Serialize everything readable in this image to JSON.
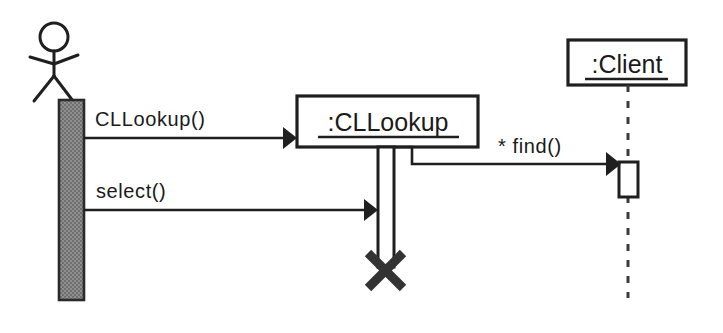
{
  "diagram": {
    "kind": "uml-sequence-diagram",
    "background_color": "#ffffff",
    "line_color": "#1f1f1f",
    "actor": {
      "name": "actor-stick-figure",
      "label": "",
      "activation_fill": "#8a8a8a"
    },
    "participants": [
      {
        "id": "cllookup",
        "label": ":CLLookup",
        "underlined": true,
        "lifeline_style": "activation-bar"
      },
      {
        "id": "client",
        "label": ":Client",
        "underlined": true,
        "lifeline_style": "dashed"
      }
    ],
    "messages": [
      {
        "id": "m1",
        "label": "CLLookup()",
        "from": "actor",
        "to": "cllookup",
        "arrow": "filled-solid"
      },
      {
        "id": "m2",
        "label": "* find()",
        "from": "cllookup",
        "to": "client",
        "arrow": "filled-solid",
        "iteration_marker": "*"
      },
      {
        "id": "m3",
        "label": "select()",
        "from": "actor",
        "to": "cllookup",
        "arrow": "filled-solid"
      }
    ],
    "destruction": {
      "id": "d1",
      "target": "cllookup",
      "marker": "X"
    }
  }
}
